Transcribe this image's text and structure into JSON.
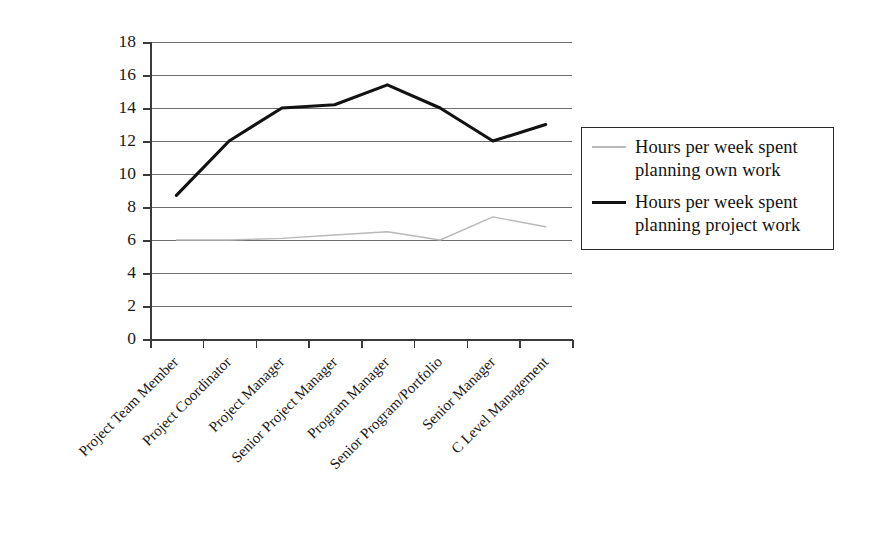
{
  "chart_data": {
    "type": "line",
    "title": "",
    "subtitle": "",
    "xlabel": "",
    "ylabel": "",
    "ylim": [
      0,
      18
    ],
    "y_ticks": [
      0,
      2,
      4,
      6,
      8,
      10,
      12,
      14,
      16,
      18
    ],
    "grid": "horizontal",
    "legend_position": "right",
    "categories": [
      "Project Team Member",
      "Project Coordinator",
      "Project Manager",
      "Senior Project Manager",
      "Program Manager",
      "Senior Program/Portfolio",
      "Senior Manager",
      "C Level Management"
    ],
    "series": [
      {
        "name": "Hours per week spent planning own work",
        "color": "#b9b9b9",
        "values": [
          6.0,
          6.0,
          6.1,
          6.3,
          6.5,
          6.0,
          7.4,
          6.8
        ]
      },
      {
        "name": "Hours per week spent planning project work",
        "color": "#121212",
        "values": [
          8.7,
          12.0,
          14.0,
          14.2,
          15.4,
          14.0,
          12.0,
          13.0
        ]
      }
    ]
  },
  "legend": {
    "entries": [
      {
        "label": "Hours per week spent planning own work",
        "swatch": "thin-gray-line"
      },
      {
        "label": "Hours per week spent planning project work",
        "swatch": "thick-black-line"
      }
    ]
  },
  "axes": {
    "y_tick_labels": [
      "18",
      "16",
      "14",
      "12",
      "10",
      "8",
      "6",
      "4",
      "2",
      "0"
    ],
    "x_tick_labels": [
      "Project Team Member",
      "Project Coordinator",
      "Project Manager",
      "Senior Project Manager",
      "Program Manager",
      "Senior Program/Portfolio",
      "Senior Manager",
      "C Level Management"
    ]
  }
}
